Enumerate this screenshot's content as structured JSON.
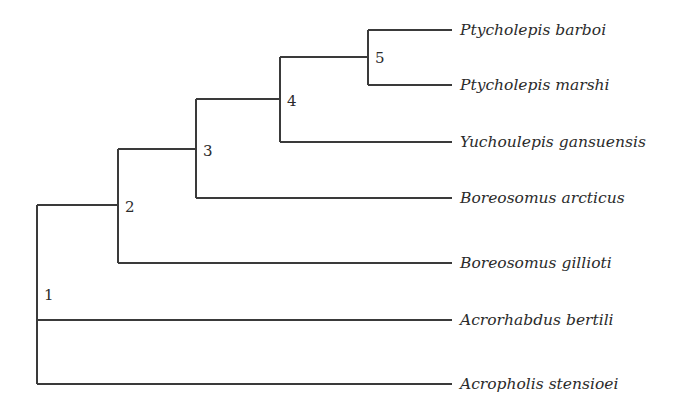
{
  "diagram": {
    "type": "cladogram",
    "colors": {
      "background": "#ffffff",
      "line": "#3a3a3a",
      "text": "#2b2b2b"
    },
    "tip_x": 452,
    "label_x": 460,
    "taxa": [
      {
        "id": "t1",
        "name": "Ptycholepis barboi",
        "y": 30
      },
      {
        "id": "t2",
        "name": "Ptycholepis marshi",
        "y": 85
      },
      {
        "id": "t3",
        "name": "Yuchoulepis gansuensis",
        "y": 142
      },
      {
        "id": "t4",
        "name": "Boreosomus arcticus",
        "y": 198
      },
      {
        "id": "t5",
        "name": "Boreosomus gillioti",
        "y": 263
      },
      {
        "id": "t6",
        "name": "Acrorhabdus bertili",
        "y": 320
      },
      {
        "id": "t7",
        "name": "Acropholis stensioei",
        "y": 384
      }
    ],
    "nodes": [
      {
        "id": "n1",
        "label": "1",
        "x": 37,
        "y_top": 205,
        "y_bottom": 384,
        "label_x": 44,
        "label_y": 300,
        "parent_y": null,
        "children": [
          "n2",
          "t6",
          "t7"
        ]
      },
      {
        "id": "n2",
        "label": "2",
        "x": 118,
        "y_top": 149,
        "y_bottom": 263,
        "label_x": 125,
        "label_y": 212,
        "parent_y": 205,
        "children": [
          "n3",
          "t5"
        ]
      },
      {
        "id": "n3",
        "label": "3",
        "x": 196,
        "y_top": 99,
        "y_bottom": 198,
        "label_x": 203,
        "label_y": 156,
        "parent_y": 149,
        "children": [
          "n4",
          "t4"
        ]
      },
      {
        "id": "n4",
        "label": "4",
        "x": 280,
        "y_top": 57,
        "y_bottom": 142,
        "label_x": 287,
        "label_y": 106,
        "parent_y": 99,
        "children": [
          "n5",
          "t3"
        ]
      },
      {
        "id": "n5",
        "label": "5",
        "x": 368,
        "y_top": 30,
        "y_bottom": 85,
        "label_x": 375,
        "label_y": 63,
        "parent_y": 57,
        "children": [
          "t1",
          "t2"
        ]
      }
    ],
    "edges": [
      {
        "id": "e-n1-n2",
        "x1": 37,
        "y1": 205,
        "x2": 118,
        "y2": 205
      },
      {
        "id": "e-n1-t6",
        "x1": 37,
        "y1": 320,
        "x2": 452,
        "y2": 320
      },
      {
        "id": "e-n1-t7",
        "x1": 37,
        "y1": 384,
        "x2": 452,
        "y2": 384
      },
      {
        "id": "e-n2-n3",
        "x1": 118,
        "y1": 149,
        "x2": 196,
        "y2": 149
      },
      {
        "id": "e-n2-t5",
        "x1": 118,
        "y1": 263,
        "x2": 452,
        "y2": 263
      },
      {
        "id": "e-n3-n4",
        "x1": 196,
        "y1": 99,
        "x2": 280,
        "y2": 99
      },
      {
        "id": "e-n3-t4",
        "x1": 196,
        "y1": 198,
        "x2": 452,
        "y2": 198
      },
      {
        "id": "e-n4-n5",
        "x1": 280,
        "y1": 57,
        "x2": 368,
        "y2": 57
      },
      {
        "id": "e-n4-t3",
        "x1": 280,
        "y1": 142,
        "x2": 452,
        "y2": 142
      },
      {
        "id": "e-n5-t1",
        "x1": 368,
        "y1": 30,
        "x2": 452,
        "y2": 30
      },
      {
        "id": "e-n5-t2",
        "x1": 368,
        "y1": 85,
        "x2": 452,
        "y2": 85
      }
    ]
  }
}
